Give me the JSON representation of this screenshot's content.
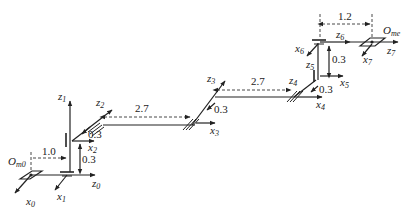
{
  "diagram": {
    "type": "robot-arm-kinematic-frames",
    "frames": {
      "base_origin": "O_m0",
      "end_origin": "O_me",
      "axes": [
        {
          "z": "z0",
          "x": "x0"
        },
        {
          "z": "z1",
          "x": "x1"
        },
        {
          "z": "z2",
          "x": "x2"
        },
        {
          "z": "z3",
          "x": "x3"
        },
        {
          "z": "z4",
          "x": "x4"
        },
        {
          "z": "z5",
          "x": "x5"
        },
        {
          "z": "z6",
          "x": "x6"
        },
        {
          "z": "z7",
          "x": "x7"
        }
      ]
    },
    "labels": {
      "O_m0_main": "O",
      "O_m0_sub": "m0",
      "O_me_main": "O",
      "O_me_sub": "me",
      "z0": "z",
      "z0s": "0",
      "z1": "z",
      "z1s": "1",
      "z2": "z",
      "z2s": "2",
      "z3": "z",
      "z3s": "3",
      "z4": "z",
      "z4s": "4",
      "z5": "z",
      "z5s": "5",
      "z6": "z",
      "z6s": "6",
      "z7": "z",
      "z7s": "7",
      "x0": "x",
      "x0s": "0",
      "x1": "x",
      "x1s": "1",
      "x2": "x",
      "x2s": "2",
      "x3": "x",
      "x3s": "3",
      "x4": "x",
      "x4s": "4",
      "x5": "x",
      "x5s": "5",
      "x6": "x",
      "x6s": "6",
      "x7": "x",
      "x7s": "7"
    },
    "dimensions": {
      "base_offset": "1.0",
      "j1_height": "0.3",
      "j2_offset": "0.3",
      "link1": "2.7",
      "j3_offset": "0.3",
      "link2": "2.7",
      "j4_offset": "0.3",
      "j5_height": "0.3",
      "end_offset": "1.2"
    }
  }
}
